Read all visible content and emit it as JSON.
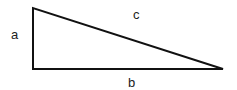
{
  "diagram": {
    "type": "right-triangle",
    "vertices": {
      "top": [
        33,
        8
      ],
      "bottom_left": [
        33,
        69
      ],
      "bottom_right": [
        223,
        69
      ]
    },
    "labels": {
      "side_vertical": "a",
      "side_horizontal": "b",
      "hypotenuse": "c"
    },
    "colors": {
      "stroke": "#111111",
      "text": "#222222",
      "background": "#ffffff"
    }
  }
}
